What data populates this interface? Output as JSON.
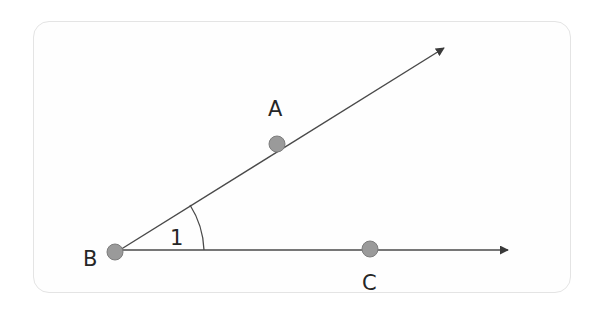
{
  "diagram": {
    "type": "geometry-angle",
    "colors": {
      "line": "#4a4a4a",
      "point_fill": "#9a9a9a",
      "point_stroke": "#7d7d7d",
      "label": "#262626",
      "panel_border": "#e4e4e4"
    },
    "points": [
      {
        "id": "B",
        "label": "B",
        "x": 115,
        "y": 252
      },
      {
        "id": "A",
        "label": "A",
        "x": 277,
        "y": 144
      },
      {
        "id": "C",
        "label": "C",
        "x": 370,
        "y": 249
      }
    ],
    "rays": [
      {
        "from": "B",
        "through": "A",
        "label": "ray-BA"
      },
      {
        "from": "B",
        "through": "C",
        "label": "ray-BC"
      }
    ],
    "angle": {
      "vertex": "B",
      "label": "1"
    }
  }
}
